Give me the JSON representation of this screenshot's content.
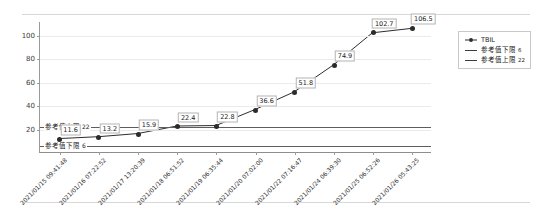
{
  "chart_data": {
    "type": "line",
    "title": "",
    "xlabel": "",
    "ylabel": "",
    "ylim": [
      0,
      112
    ],
    "yticks": [
      20,
      40,
      60,
      80,
      100
    ],
    "grid": true,
    "legend_position": "top-right",
    "categories": [
      "2021/01/15 09:41:48",
      "2021/01/16 07:22:52",
      "2021/01/17 13:20:39",
      "2021/01/18 06:51:52",
      "2021/01/19 06:35:44",
      "2021/01/20 07:02:00",
      "2021/01/22 07:16:47",
      "2021/01/24 06:39:30",
      "2021/01/25 06:52:26",
      "2021/01/26 05:43:25"
    ],
    "series": [
      {
        "name": "TBIL",
        "values": [
          11.6,
          13.2,
          15.9,
          22.4,
          22.8,
          36.6,
          51.8,
          74.9,
          102.7,
          106.5
        ],
        "color": "#2b2b2b"
      }
    ],
    "reference_lines": [
      {
        "name": "参考值上限",
        "value": 22,
        "label": "参考值上限",
        "value_text": "22",
        "color": "#5d5d5d"
      },
      {
        "name": "参考值下限",
        "value": 6,
        "label": "参考值下限",
        "value_text": "6",
        "color": "#5d5d5d"
      }
    ],
    "data_labels": [
      "11.6",
      "13.2",
      "15.9",
      "22.4",
      "22.8",
      "36.6",
      "51.8",
      "74.9",
      "102.7",
      "106.5"
    ]
  },
  "legend": {
    "items": [
      {
        "label": "TBIL",
        "value_text": "",
        "marker": "line-marker",
        "color": "#2b2b2b"
      },
      {
        "label": "参考值下限",
        "value_text": "6",
        "marker": "line",
        "color": "#3c3c3c"
      },
      {
        "label": "参考值上限",
        "value_text": "22",
        "marker": "line",
        "color": "#3c3c3c"
      }
    ]
  },
  "axis": {
    "y_tick_labels": [
      "20",
      "40",
      "60",
      "80",
      "100"
    ]
  }
}
